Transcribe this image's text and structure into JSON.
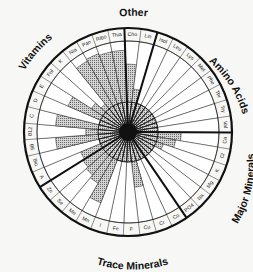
{
  "chart_data": {
    "type": "radial-bar",
    "title": "",
    "groups": [
      {
        "name": "Other",
        "segments": [
          "Cho",
          "Lin"
        ]
      },
      {
        "name": "Amino Acids",
        "segments": [
          "Isol",
          "Leu",
          "Lys",
          "Met",
          "Phe",
          "Thr",
          "Try",
          "Val"
        ]
      },
      {
        "name": "Major Minerals",
        "segments": [
          "Ca",
          "Cl",
          "K",
          "Mg",
          "Na",
          "PO4"
        ]
      },
      {
        "name": "Trace Minerals",
        "segments": [
          "Co",
          "Cr",
          "Cu",
          "F",
          "Fe",
          "I",
          "Mn",
          "Mo",
          "Se",
          "Zn"
        ]
      },
      {
        "name": "Vitamins",
        "segments": [
          "A",
          "Bio",
          "B6",
          "B12",
          "C",
          "D",
          "E",
          "Fol",
          "K",
          "Nia",
          "Pan",
          "Ribo",
          "Thia"
        ]
      }
    ],
    "categories": [
      "Cho",
      "Lin",
      "Isol",
      "Leu",
      "Lys",
      "Met",
      "Phe",
      "Thr",
      "Try",
      "Val",
      "Ca",
      "Cl",
      "K",
      "Mg",
      "Na",
      "PO4",
      "Co",
      "Cr",
      "Cu",
      "F",
      "Fe",
      "I",
      "Mn",
      "Mo",
      "Se",
      "Zn",
      "A",
      "Bio",
      "B6",
      "B12",
      "C",
      "D",
      "E",
      "Fol",
      "K",
      "Nia",
      "Pan",
      "Ribo",
      "Thia"
    ],
    "values": [
      62,
      22,
      0,
      0,
      0,
      0,
      0,
      0,
      0,
      0,
      38,
      30,
      12,
      0,
      0,
      0,
      0,
      0,
      42,
      0,
      0,
      0,
      75,
      48,
      42,
      38,
      35,
      0,
      70,
      20,
      70,
      0,
      58,
      22,
      10,
      85,
      88,
      85,
      85
    ],
    "value_note": "Shaded bar length as % of wheel radius (estimated); 0 = no shaded bar beyond hub",
    "rlim": [
      0,
      100
    ],
    "grid": true,
    "legend": "none",
    "colors": {
      "shade": "#9a9a9a",
      "outline": "#111111",
      "background": "#ffffff"
    }
  },
  "labels": {
    "groups": {
      "other": "Other",
      "amino": "Amino Acids",
      "major": "Major Minerals",
      "trace": "Trace Minerals",
      "vitamins": "Vitamins"
    }
  }
}
